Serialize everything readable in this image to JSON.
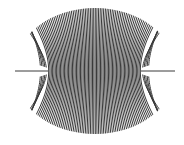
{
  "figure": {
    "title": "",
    "line_color": "#3a3a3a",
    "background": "#ffffff",
    "line_width": 1.0,
    "envelope": {
      "cx": 95,
      "cy": 71,
      "rx": 81,
      "ry": 63
    },
    "neck": {
      "left_x": 48,
      "right_x": 141,
      "y": 71
    },
    "axis_lines": [
      {
        "x1": 15,
        "x2": 48,
        "y": 71
      },
      {
        "x1": 141,
        "x2": 175,
        "y": 71
      }
    ],
    "line_count": 70
  }
}
